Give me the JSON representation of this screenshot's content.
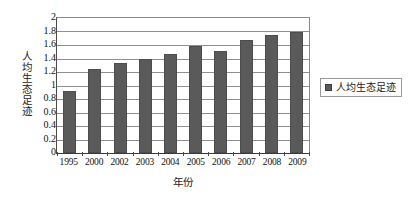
{
  "chart_data": {
    "type": "bar",
    "title": "",
    "xlabel": "年份",
    "ylabel": "人均生态足迹",
    "ylim": [
      0,
      2
    ],
    "ystep": 0.2,
    "grid": true,
    "legend_position": "right",
    "categories": [
      "1995",
      "2000",
      "2002",
      "2003",
      "2004",
      "2005",
      "2006",
      "2007",
      "2008",
      "2009"
    ],
    "ytick_labels": [
      "2",
      "1.8",
      "1.6",
      "1.4",
      "1.2",
      "1",
      "0.8",
      "0.6",
      "0.4",
      "0.2",
      "0"
    ],
    "ytick_values": [
      2,
      1.8,
      1.6,
      1.4,
      1.2,
      1,
      0.8,
      0.6,
      0.4,
      0.2,
      0
    ],
    "series": [
      {
        "name": "人均生态足迹",
        "color": "#5a5a5a",
        "values": [
          0.92,
          1.24,
          1.33,
          1.4,
          1.46,
          1.59,
          1.51,
          1.68,
          1.75,
          1.79
        ]
      }
    ]
  },
  "legend": {
    "entries": [
      {
        "label": "人均生态足迹",
        "swatch": "legend-swatch-icon"
      }
    ]
  },
  "colors": {
    "bar": "#5a5a5a",
    "gridline": "#8f8f8f",
    "axis": "#3a3a3a",
    "text": "#111111",
    "background": "#ffffff"
  }
}
